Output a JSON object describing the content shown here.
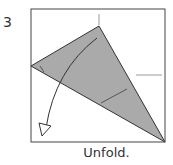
{
  "step_number": "3",
  "caption": "Unfold.",
  "colors": {
    "paper_fill": "#aaaaaa",
    "line": "#333333",
    "crease": "#999999"
  }
}
